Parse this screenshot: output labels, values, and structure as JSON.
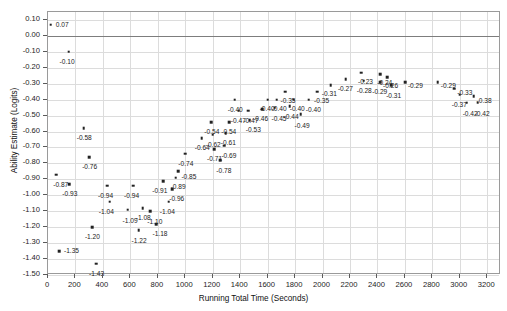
{
  "chart_data": {
    "type": "scatter",
    "title": "",
    "xlabel": "Running Total Time (Seconds)",
    "ylabel": "Ability Estimate (Logits)",
    "xlim": [
      0,
      3300
    ],
    "ylim": [
      -1.5,
      0.15
    ],
    "xticks": [
      0,
      200,
      400,
      600,
      800,
      1000,
      1200,
      1400,
      1600,
      1800,
      2000,
      2200,
      2400,
      2600,
      2800,
      3000,
      3200
    ],
    "xtick_labels": [
      "0",
      "200",
      "400",
      "600",
      "800",
      "1000",
      "1200",
      "1400",
      "1600",
      "1800",
      "2000",
      "2200",
      "2400",
      "2600",
      "2800",
      "3000",
      "3200"
    ],
    "yticks": [
      0.1,
      0.0,
      -0.1,
      -0.2,
      -0.3,
      -0.4,
      -0.5,
      -0.6,
      -0.7,
      -0.8,
      -0.9,
      -1.0,
      -1.1,
      -1.2,
      -1.3,
      -1.4,
      -1.5
    ],
    "ytick_labels": [
      "0.10",
      "0.00",
      "-0.10",
      "-0.20",
      "-0.30",
      "-0.40",
      "-0.50",
      "-0.60",
      "-0.70",
      "-0.80",
      "-0.90",
      "-1.00",
      "-1.10",
      "-1.20",
      "-1.30",
      "-1.40",
      "-1.50"
    ],
    "grid": true,
    "zero_line": 0.0,
    "legend": null,
    "marker_color": "#222222",
    "grid_color": "#dcdcdc",
    "points": [
      {
        "x": 20,
        "y": 0.07,
        "label": "0.07",
        "lx": 5,
        "ly": -3
      },
      {
        "x": 150,
        "y": -0.1,
        "label": "-0.10",
        "lx": -9,
        "ly": 7
      },
      {
        "x": 260,
        "y": -0.58,
        "label": "-0.58",
        "lx": -7,
        "ly": 7
      },
      {
        "x": 60,
        "y": -0.87,
        "label": "-0.87",
        "lx": -3,
        "ly": 7
      },
      {
        "x": 155,
        "y": -0.93,
        "label": "-0.93",
        "lx": -7,
        "ly": 7
      },
      {
        "x": 320,
        "y": -1.2,
        "label": "-1.20",
        "lx": -7,
        "ly": 7
      },
      {
        "x": 80,
        "y": -1.35,
        "label": "-1.35",
        "lx": 5,
        "ly": -3
      },
      {
        "x": 350,
        "y": -1.43,
        "label": "-1.43",
        "lx": -7,
        "ly": 7
      },
      {
        "x": 300,
        "y": -0.76,
        "label": "-0.76",
        "lx": -7,
        "ly": 7
      },
      {
        "x": 430,
        "y": -0.94,
        "label": "-0.94",
        "lx": -9,
        "ly": 7
      },
      {
        "x": 450,
        "y": -1.04,
        "label": "-1.04",
        "lx": -11,
        "ly": 7
      },
      {
        "x": 580,
        "y": -1.09,
        "label": "-1.09",
        "lx": -5,
        "ly": 8
      },
      {
        "x": 620,
        "y": -0.94,
        "label": "-0.94",
        "lx": -9,
        "ly": 7
      },
      {
        "x": 690,
        "y": -1.08,
        "label": "-1.08",
        "lx": -7,
        "ly": 7
      },
      {
        "x": 745,
        "y": -1.1,
        "label": "-1.10",
        "lx": -3,
        "ly": 8
      },
      {
        "x": 660,
        "y": -1.22,
        "label": "-1.22",
        "lx": -7,
        "ly": 8
      },
      {
        "x": 790,
        "y": -1.18,
        "label": "-1.18",
        "lx": -4,
        "ly": 7
      },
      {
        "x": 840,
        "y": -0.91,
        "label": "-0.91",
        "lx": -11,
        "ly": 7
      },
      {
        "x": 880,
        "y": -1.04,
        "label": "-1.04",
        "lx": -9,
        "ly": 7
      },
      {
        "x": 905,
        "y": -0.96,
        "label": "-0.96",
        "lx": -3,
        "ly": 7
      },
      {
        "x": 930,
        "y": -0.89,
        "label": "-0.89",
        "lx": -5,
        "ly": 6
      },
      {
        "x": 950,
        "y": -0.85,
        "label": "-0.85",
        "lx": 3,
        "ly": 3
      },
      {
        "x": 1000,
        "y": -0.74,
        "label": "-0.74",
        "lx": -7,
        "ly": 7
      },
      {
        "x": 1120,
        "y": -0.64,
        "label": "-0.64",
        "lx": -7,
        "ly": 7
      },
      {
        "x": 1210,
        "y": -0.71,
        "label": "-0.71",
        "lx": -7,
        "ly": 7
      },
      {
        "x": 1200,
        "y": -0.62,
        "label": "-0.62",
        "lx": -7,
        "ly": 7
      },
      {
        "x": 1190,
        "y": -0.54,
        "label": "-0.54",
        "lx": -7,
        "ly": 7
      },
      {
        "x": 1295,
        "y": -0.61,
        "label": "-0.61",
        "lx": -5,
        "ly": 7
      },
      {
        "x": 1285,
        "y": -0.69,
        "label": "-0.69",
        "lx": -3,
        "ly": 7
      },
      {
        "x": 1255,
        "y": -0.78,
        "label": "-0.78",
        "lx": -4,
        "ly": 8
      },
      {
        "x": 1320,
        "y": -0.54,
        "label": "-0.54",
        "lx": -8,
        "ly": 7
      },
      {
        "x": 1360,
        "y": -0.4,
        "label": "-0.40",
        "lx": -7,
        "ly": 7
      },
      {
        "x": 1390,
        "y": -0.47,
        "label": "-0.47",
        "lx": -8,
        "ly": 7
      },
      {
        "x": 1460,
        "y": -0.47,
        "label": "-0.47",
        "lx": -5,
        "ly": 7
      },
      {
        "x": 1470,
        "y": -0.53,
        "label": "-0.53",
        "lx": -4,
        "ly": 7
      },
      {
        "x": 1560,
        "y": -0.46,
        "label": "-0.46",
        "lx": -9,
        "ly": 7
      },
      {
        "x": 1600,
        "y": -0.4,
        "label": "-0.40",
        "lx": -8,
        "ly": 6
      },
      {
        "x": 1665,
        "y": -0.4,
        "label": "-0.40",
        "lx": -5,
        "ly": 6
      },
      {
        "x": 1650,
        "y": -0.45,
        "label": "-0.45",
        "lx": -3,
        "ly": 8
      },
      {
        "x": 1730,
        "y": -0.35,
        "label": "-0.35",
        "lx": -5,
        "ly": 6
      },
      {
        "x": 1790,
        "y": -0.4,
        "label": "-0.40",
        "lx": -4,
        "ly": 6
      },
      {
        "x": 1760,
        "y": -0.44,
        "label": "-0.44",
        "lx": -6,
        "ly": 8
      },
      {
        "x": 1840,
        "y": -0.49,
        "label": "-0.49",
        "lx": -6,
        "ly": 9
      },
      {
        "x": 1900,
        "y": -0.4,
        "label": "-0.40",
        "lx": -3,
        "ly": 7
      },
      {
        "x": 1960,
        "y": -0.35,
        "label": "-0.35",
        "lx": -3,
        "ly": 6
      },
      {
        "x": 2060,
        "y": -0.31,
        "label": "-0.31",
        "lx": -9,
        "ly": 6
      },
      {
        "x": 2170,
        "y": -0.27,
        "label": "-0.27",
        "lx": -8,
        "ly": 7
      },
      {
        "x": 2280,
        "y": -0.23,
        "label": "-0.23",
        "lx": -3,
        "ly": 6
      },
      {
        "x": 2300,
        "y": -0.28,
        "label": "-0.28",
        "lx": -7,
        "ly": 7
      },
      {
        "x": 2420,
        "y": -0.24,
        "label": "-0.24",
        "lx": -3,
        "ly": 6
      },
      {
        "x": 2420,
        "y": -0.29,
        "label": "-0.29",
        "lx": -8,
        "ly": 7
      },
      {
        "x": 2470,
        "y": -0.26,
        "label": "-0.26",
        "lx": -4,
        "ly": 6
      },
      {
        "x": 2500,
        "y": -0.31,
        "label": "-0.31",
        "lx": -5,
        "ly": 8
      },
      {
        "x": 2600,
        "y": -0.29,
        "label": "-0.29",
        "lx": 3,
        "ly": 1
      },
      {
        "x": 2840,
        "y": -0.29,
        "label": "-0.29",
        "lx": 3,
        "ly": 1
      },
      {
        "x": 2960,
        "y": -0.33,
        "label": "-0.33",
        "lx": 3,
        "ly": 1
      },
      {
        "x": 3000,
        "y": -0.37,
        "label": "-0.37",
        "lx": -8,
        "ly": 7
      },
      {
        "x": 3100,
        "y": -0.38,
        "label": "-0.38",
        "lx": 3,
        "ly": 2
      },
      {
        "x": 3050,
        "y": -0.42,
        "label": "-0.42",
        "lx": -4,
        "ly": 8
      },
      {
        "x": 3130,
        "y": -0.42,
        "label": "-0.42",
        "lx": -3,
        "ly": 8
      }
    ]
  }
}
